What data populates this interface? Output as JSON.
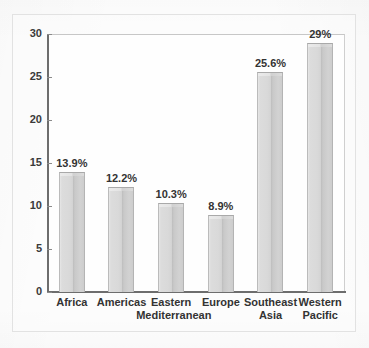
{
  "chart_data": {
    "type": "bar",
    "title": "",
    "subtitle": "",
    "xlabel": "",
    "ylabel": "",
    "ylim": [
      0,
      30
    ],
    "yticks": [
      0,
      5,
      10,
      15,
      20,
      25,
      30
    ],
    "ytick_labels": [
      "0",
      "5",
      "10",
      "15",
      "20",
      "25",
      "30"
    ],
    "grid": false,
    "legend": false,
    "categories": [
      "Africa",
      "Americas",
      "Eastern Mediterranean",
      "Europe",
      "Southeast Asia",
      "Western Pacific"
    ],
    "category_lines": [
      [
        "Africa",
        ""
      ],
      [
        "Americas",
        ""
      ],
      [
        "Eastern",
        "Mediterranean"
      ],
      [
        "Europe",
        ""
      ],
      [
        "Southeast",
        "Asia"
      ],
      [
        "Western",
        "Pacific"
      ]
    ],
    "values": [
      13.9,
      12.2,
      10.3,
      8.9,
      25.6,
      29
    ],
    "data_labels": [
      "13.9%",
      "12.2%",
      "10.3%",
      "8.9%",
      "25.6%",
      "29%"
    ],
    "colors": {
      "bar_fill": "#d8d8d8",
      "bar_shadow": "#bdbdbd",
      "bar_edge": "#b4b4b4",
      "axis": "#6d6d6d",
      "text": "#333333",
      "plot_background": "#fefefe",
      "page_background": "#fdfdfd",
      "frame": "#e2e2e2"
    }
  }
}
